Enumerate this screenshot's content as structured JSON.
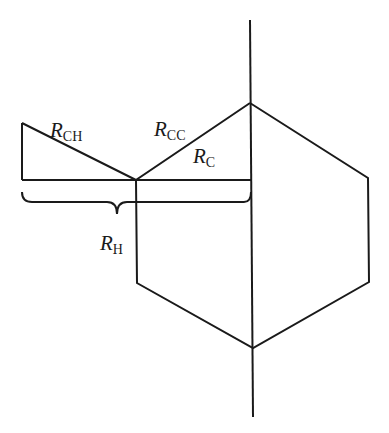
{
  "diagram": {
    "type": "geometric-schematic",
    "colors": {
      "line": "#1a1a1a",
      "background": "#ffffff"
    },
    "labels": {
      "r_ch": {
        "main": "R",
        "sub": "CH"
      },
      "r_cc": {
        "main": "R",
        "sub": "CC"
      },
      "r_c": {
        "main": "R",
        "sub": "C"
      },
      "r_h": {
        "main": "R",
        "sub": "H"
      }
    }
  }
}
